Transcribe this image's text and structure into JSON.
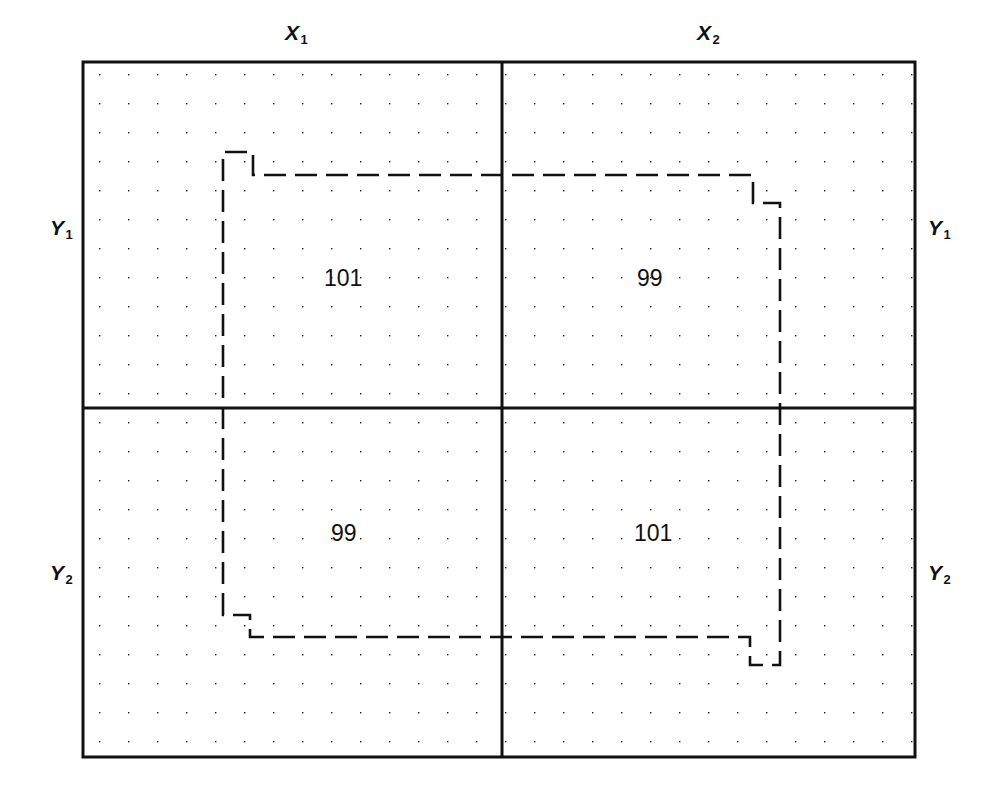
{
  "figure": {
    "title": "",
    "kind": "latin-square-field-plot",
    "background_color": "#ffffff",
    "line_color": "#111111",
    "dot_color": "#1a1a1a"
  },
  "axis_labels": {
    "top_left": {
      "base": "X",
      "sub": "1"
    },
    "top_right": {
      "base": "X",
      "sub": "2"
    },
    "left_upper": {
      "base": "Y",
      "sub": "1"
    },
    "left_lower": {
      "base": "Y",
      "sub": "2"
    },
    "right_upper": {
      "base": "Y",
      "sub": "1"
    },
    "right_lower": {
      "base": "Y",
      "sub": "2"
    }
  },
  "cells": [
    {
      "row": "Y1",
      "col": "X1",
      "value": "101"
    },
    {
      "row": "Y1",
      "col": "X2",
      "value": "99"
    },
    {
      "row": "Y2",
      "col": "X1",
      "value": "99"
    },
    {
      "row": "Y2",
      "col": "X2",
      "value": "101"
    }
  ],
  "chart_data": {
    "type": "table",
    "title": "",
    "xlabel": "",
    "ylabel": "",
    "columns": [
      "X1",
      "X2"
    ],
    "rows": [
      "Y1",
      "Y2"
    ],
    "values": [
      [
        101,
        99
      ],
      [
        99,
        101
      ]
    ],
    "grid": true,
    "legend": "none",
    "annotations": [
      "dashed region boundary enclosing the central portion of all four quadrants"
    ]
  },
  "geometry": {
    "frame": {
      "x0": 83,
      "y0": 62,
      "x1": 915,
      "y1": 757
    },
    "divider_x": 502,
    "divider_y": 408,
    "dot_origin": {
      "x": 99,
      "y": 74
    },
    "dot_spacing": 29,
    "dashed_path": "M223,615 L223,152 L253,152 L253,175 L753,175 L753,203 L780,203 L780,665 L750,665 L750,637 L250,637 L250,615 Z"
  }
}
